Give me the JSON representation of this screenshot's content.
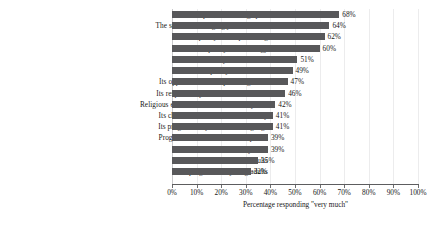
{
  "chart_data": {
    "type": "bar",
    "orientation": "horizontal",
    "title": "",
    "xlabel": "Percentage responding \"very much\"",
    "ylabel": "",
    "xlim": [
      0,
      100
    ],
    "grid": true,
    "legend": false,
    "bar_color": "#58585a",
    "gridline_color": "#ececed",
    "axis_color": "#5d5d5f",
    "text_color": "#181818",
    "xticks": [
      "0%",
      "10%",
      "20%",
      "30%",
      "40%",
      "50%",
      "60%",
      "70%",
      "80%",
      "90%",
      "100%"
    ],
    "xtick_values": [
      0,
      10,
      20,
      30,
      40,
      50,
      60,
      70,
      80,
      90,
      100
    ],
    "categories": [
      "Its open, welcoming spirit",
      "The sense of belonging you feel there",
      "The quality of the preaching",
      "The quality of the liturgy",
      "The beauty of the church",
      "The quality of the music",
      "Its opportunities for spiritual growth",
      "Its respect for your cultural traditions",
      "Religious education for children and youth",
      "Its character as a diverse community",
      "Its programs in your native language",
      "Programs and activities of the parish",
      "Its commitment to social justice",
      "Its faith formation for adults",
      "Its programs for young adults"
    ],
    "values": [
      68,
      64,
      62,
      60,
      51,
      49,
      47,
      46,
      42,
      41,
      41,
      39,
      39,
      35,
      32
    ],
    "value_labels": [
      "68%",
      "64%",
      "62%",
      "60%",
      "51%",
      "49%",
      "47%",
      "46%",
      "42%",
      "41%",
      "41%",
      "39%",
      "39%",
      "35%",
      "32%"
    ]
  }
}
